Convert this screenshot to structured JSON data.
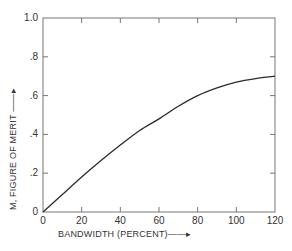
{
  "chart_data": {
    "type": "line",
    "title": "",
    "xlabel": "BANDWIDTH (PERCENT)",
    "ylabel": "M, FIGURE OF MERIT",
    "xlim": [
      0,
      120
    ],
    "ylim": [
      0,
      1.0
    ],
    "x_ticks": [
      "0",
      "20",
      "40",
      "60",
      "80",
      "100",
      "120"
    ],
    "y_ticks": [
      "0",
      ".2",
      ".4",
      ".6",
      ".8",
      "1.0"
    ],
    "grid": false,
    "legend": null,
    "series": [
      {
        "name": "M",
        "x": [
          0,
          10,
          20,
          30,
          40,
          50,
          60,
          70,
          80,
          90,
          100,
          110,
          120
        ],
        "values": [
          0,
          0.09,
          0.18,
          0.265,
          0.345,
          0.42,
          0.48,
          0.545,
          0.6,
          0.64,
          0.67,
          0.688,
          0.7
        ]
      }
    ]
  },
  "axes": {
    "x_title": "BANDWIDTH (PERCENT)",
    "x_arrow": "→",
    "y_title": "M, FIGURE OF MERIT",
    "y_arrow": "→",
    "y_tick_labels": [
      "1.0",
      ".8",
      ".6",
      ".4",
      ".2",
      "0"
    ],
    "x_tick_labels": [
      "0",
      "20",
      "40",
      "60",
      "80",
      "100",
      "120"
    ]
  }
}
